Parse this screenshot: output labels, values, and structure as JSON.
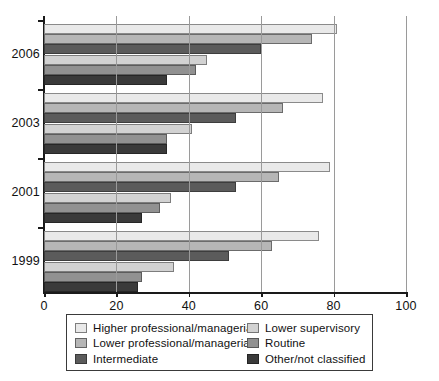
{
  "chart_data": {
    "type": "bar",
    "orientation": "horizontal",
    "title": "",
    "xlabel": "",
    "ylabel": "",
    "xlim": [
      0,
      100
    ],
    "xticks": [
      0,
      20,
      40,
      60,
      80,
      100
    ],
    "grid": true,
    "legend_position": "bottom",
    "categories": [
      "2006",
      "2003",
      "2001",
      "1999"
    ],
    "series": [
      {
        "name": "Higher professional/managerial",
        "color": "#e9e9e9",
        "values": [
          81,
          77,
          79,
          76
        ]
      },
      {
        "name": "Lower professional/managerial",
        "color": "#b6b6b6",
        "values": [
          74,
          66,
          65,
          63
        ]
      },
      {
        "name": "Intermediate",
        "color": "#5b5b5b",
        "values": [
          60,
          53,
          53,
          51
        ]
      },
      {
        "name": "Lower supervisory",
        "color": "#d2d2d2",
        "values": [
          45,
          41,
          35,
          36
        ]
      },
      {
        "name": "Routine",
        "color": "#919191",
        "values": [
          42,
          34,
          32,
          27
        ]
      },
      {
        "name": "Other/not classified",
        "color": "#3a3a3a",
        "values": [
          34,
          34,
          27,
          26
        ]
      }
    ]
  },
  "axis": {
    "x_tick_labels": [
      "0",
      "20",
      "40",
      "60",
      "80",
      "100"
    ],
    "y_tick_labels": [
      "2006",
      "2003",
      "2001",
      "1999"
    ]
  },
  "legend": {
    "left_column": [
      {
        "label": "Higher professional/managerial",
        "swatch": "swatch-higher-professional"
      },
      {
        "label": "Lower professional/managerial",
        "swatch": "swatch-lower-professional"
      },
      {
        "label": "Intermediate",
        "swatch": "swatch-intermediate"
      }
    ],
    "right_column": [
      {
        "label": "Lower supervisory",
        "swatch": "swatch-lower-supervisory"
      },
      {
        "label": "Routine",
        "swatch": "swatch-routine"
      },
      {
        "label": "Other/not classified",
        "swatch": "swatch-other-not-classified"
      }
    ]
  }
}
